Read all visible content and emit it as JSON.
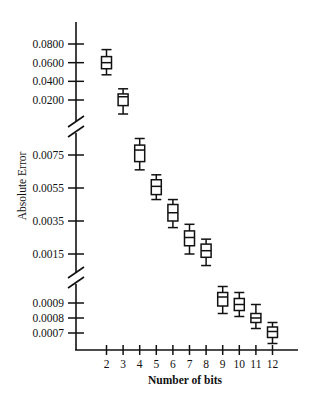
{
  "chart_data": {
    "type": "box",
    "title": "",
    "xlabel": "Number of bits",
    "ylabel": "Absolute Error",
    "categories": [
      "2",
      "3",
      "4",
      "5",
      "6",
      "7",
      "8",
      "9",
      "10",
      "11",
      "12"
    ],
    "y_axis": {
      "broken": true,
      "segments": [
        {
          "name": "upper",
          "ticks": [
            "0.0800",
            "0.0600",
            "0.0400",
            "0.0200"
          ]
        },
        {
          "name": "middle",
          "ticks": [
            "0.0075",
            "0.0055",
            "0.0035",
            "0.0015"
          ]
        },
        {
          "name": "lower",
          "ticks": [
            "0.0009",
            "0.0008",
            "0.0007"
          ]
        }
      ]
    },
    "series": [
      {
        "name": "Absolute Error",
        "boxes": [
          {
            "x": "2",
            "segment": "upper",
            "whisker_high": 0.074,
            "q3": 0.0665,
            "median": 0.06,
            "q1": 0.0535,
            "whisker_low": 0.047
          },
          {
            "x": "3",
            "segment": "upper",
            "whisker_high": 0.032,
            "q3": 0.0265,
            "median": 0.0235,
            "q1": 0.014,
            "whisker_low": 0.005
          },
          {
            "x": "4",
            "segment": "middle",
            "whisker_high": 0.0085,
            "q3": 0.0081,
            "median": 0.0078,
            "q1": 0.0071,
            "whisker_low": 0.0066
          },
          {
            "x": "5",
            "segment": "middle",
            "whisker_high": 0.0063,
            "q3": 0.006,
            "median": 0.0056,
            "q1": 0.0051,
            "whisker_low": 0.0048
          },
          {
            "x": "6",
            "segment": "middle",
            "whisker_high": 0.0048,
            "q3": 0.0045,
            "median": 0.004,
            "q1": 0.0035,
            "whisker_low": 0.0031
          },
          {
            "x": "7",
            "segment": "middle",
            "whisker_high": 0.0033,
            "q3": 0.0029,
            "median": 0.0025,
            "q1": 0.002,
            "whisker_low": 0.0015
          },
          {
            "x": "8",
            "segment": "middle",
            "whisker_high": 0.0024,
            "q3": 0.0021,
            "median": 0.0017,
            "q1": 0.0013,
            "whisker_low": 0.0008
          },
          {
            "x": "9",
            "segment": "lower",
            "whisker_high": 0.00101,
            "q3": 0.00097,
            "median": 0.00094,
            "q1": 0.00088,
            "whisker_low": 0.00083
          },
          {
            "x": "10",
            "segment": "lower",
            "whisker_high": 0.00097,
            "q3": 0.00093,
            "median": 0.00089,
            "q1": 0.00085,
            "whisker_low": 0.00081
          },
          {
            "x": "11",
            "segment": "lower",
            "whisker_high": 0.00089,
            "q3": 0.00083,
            "median": 0.0008,
            "q1": 0.00077,
            "whisker_low": 0.00073
          },
          {
            "x": "12",
            "segment": "lower",
            "whisker_high": 0.00077,
            "q3": 0.00074,
            "median": 0.00071,
            "q1": 0.00067,
            "whisker_low": 0.00063
          }
        ]
      }
    ],
    "grid": false,
    "legend": null
  }
}
